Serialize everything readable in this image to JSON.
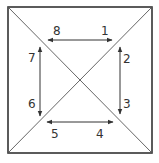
{
  "diagram": {
    "colors": {
      "outline": "#333333",
      "diagonal": "#555555",
      "arrow": "#333333",
      "background": "#ffffff"
    },
    "outer_square": {
      "x1": 8,
      "y1": 7,
      "x2": 152,
      "y2": 153
    },
    "center": {
      "x": 80,
      "y": 81
    },
    "arrows": [
      {
        "id": "top",
        "from_label": "8",
        "to_label": "1",
        "x1": 48,
        "y1": 40,
        "x2": 112,
        "y2": 40
      },
      {
        "id": "right",
        "from_label": "2",
        "to_label": "3",
        "x1": 120,
        "y1": 47,
        "x2": 120,
        "y2": 114
      },
      {
        "id": "bottom",
        "from_label": "5",
        "to_label": "4",
        "x1": 47,
        "y1": 122,
        "x2": 113,
        "y2": 122
      },
      {
        "id": "left",
        "from_label": "7",
        "to_label": "6",
        "x1": 40,
        "y1": 47,
        "x2": 40,
        "y2": 116
      }
    ],
    "labels": {
      "l1": "1",
      "l2": "2",
      "l3": "3",
      "l4": "4",
      "l5": "5",
      "l6": "6",
      "l7": "7",
      "l8": "8"
    }
  }
}
